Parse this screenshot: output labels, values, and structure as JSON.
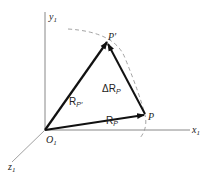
{
  "diagram": {
    "axes": {
      "x": {
        "label": "x",
        "subscript": "1"
      },
      "y": {
        "label": "y",
        "subscript": "1"
      },
      "z": {
        "label": "z",
        "subscript": "1"
      }
    },
    "origin": {
      "label": "O",
      "subscript": "1"
    },
    "points": {
      "P": {
        "label": "P"
      },
      "P_prime": {
        "label": "P′"
      }
    },
    "vectors": {
      "R_P": {
        "label": "R",
        "subscript": "P"
      },
      "R_P_prime": {
        "label": "R",
        "subscript": "P′"
      },
      "delta_R_P": {
        "label": "ΔR",
        "subscript": "P"
      }
    },
    "colors": {
      "axis": "#888888",
      "vector": "#111111",
      "arc": "#999999"
    }
  }
}
